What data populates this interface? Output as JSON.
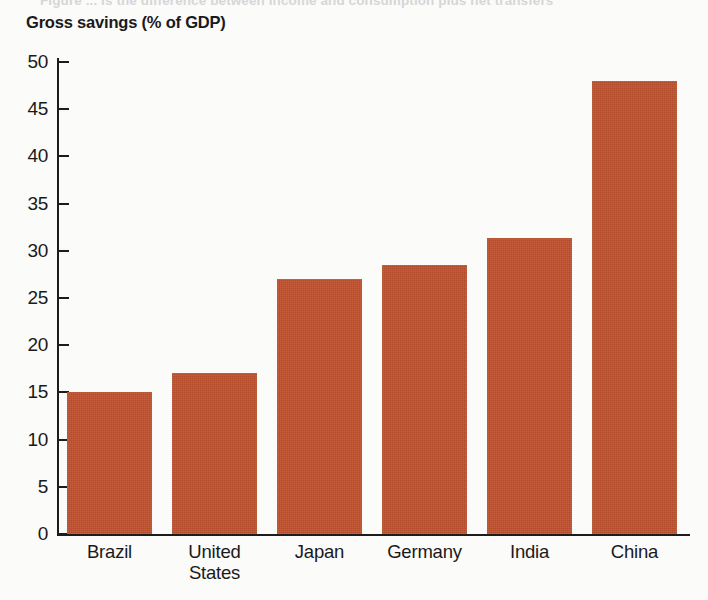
{
  "figure": {
    "clipped_caption": "Figure  ... is the difference between income and consumption plus net transfers",
    "background_color": "#fbfbfa"
  },
  "chart_data": {
    "type": "bar",
    "title": "Gross savings (% of GDP)",
    "xlabel": "",
    "ylabel": "",
    "categories": [
      "Brazil",
      "United States",
      "Japan",
      "Germany",
      "India",
      "China"
    ],
    "category_lines": [
      [
        "Brazil"
      ],
      [
        "United",
        "States"
      ],
      [
        "Japan"
      ],
      [
        "Germany"
      ],
      [
        "India"
      ],
      [
        "China"
      ]
    ],
    "values": [
      15.0,
      17.1,
      27.0,
      28.5,
      31.4,
      48.0
    ],
    "ylim": [
      0,
      50
    ],
    "ytick_labels": [
      "0",
      "5",
      "10",
      "15",
      "20",
      "25",
      "30",
      "35",
      "40",
      "45",
      "50"
    ],
    "ytick_values": [
      0,
      5,
      10,
      15,
      20,
      25,
      30,
      35,
      40,
      45,
      50
    ],
    "grid": false,
    "legend": false,
    "bar_color": "#c0522f",
    "axis_color": "#1c1c1c"
  }
}
